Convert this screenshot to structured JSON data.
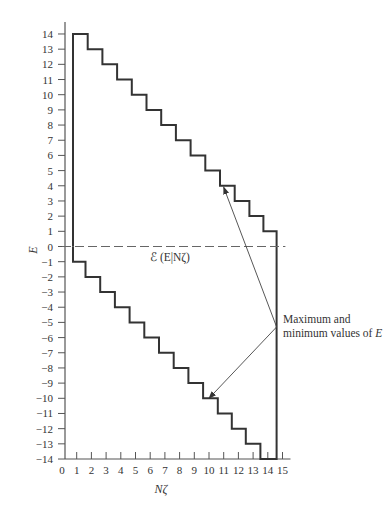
{
  "chart_data": {
    "type": "line",
    "subtype": "step",
    "title": "",
    "xlabel": "Nζ",
    "ylabel": "E",
    "xlim": [
      0,
      15
    ],
    "ylim": [
      -14,
      14
    ],
    "x_ticks": [
      0,
      1,
      2,
      3,
      4,
      5,
      6,
      7,
      8,
      9,
      10,
      11,
      12,
      13,
      14,
      15
    ],
    "y_ticks": [
      14,
      13,
      12,
      11,
      10,
      9,
      8,
      7,
      6,
      5,
      4,
      3,
      2,
      1,
      0,
      -1,
      -2,
      -3,
      -4,
      -5,
      -6,
      -7,
      -8,
      -9,
      -10,
      -11,
      -12,
      -13,
      -14
    ],
    "grid": false,
    "legend": null,
    "series": [
      {
        "name": "Maximum values of E",
        "style": "solid-step",
        "points": [
          [
            0.75,
            0
          ],
          [
            0.75,
            14
          ],
          [
            1.75,
            14
          ],
          [
            1.75,
            13
          ],
          [
            2.75,
            13
          ],
          [
            2.75,
            12
          ],
          [
            3.75,
            12
          ],
          [
            3.75,
            11
          ],
          [
            4.75,
            11
          ],
          [
            4.75,
            10
          ],
          [
            5.75,
            10
          ],
          [
            5.75,
            9
          ],
          [
            6.75,
            9
          ],
          [
            6.75,
            8
          ],
          [
            7.75,
            8
          ],
          [
            7.75,
            7
          ],
          [
            8.75,
            7
          ],
          [
            8.75,
            6
          ],
          [
            9.75,
            6
          ],
          [
            9.75,
            5
          ],
          [
            10.75,
            5
          ],
          [
            10.75,
            4
          ],
          [
            11.75,
            4
          ],
          [
            11.75,
            3
          ],
          [
            12.75,
            3
          ],
          [
            12.75,
            2
          ],
          [
            13.7,
            2
          ],
          [
            13.7,
            1
          ],
          [
            14.6,
            1
          ],
          [
            14.6,
            0
          ]
        ]
      },
      {
        "name": "Minimum values of E",
        "style": "solid-step",
        "points": [
          [
            0.75,
            0
          ],
          [
            0.75,
            -1
          ],
          [
            1.6,
            -1
          ],
          [
            1.6,
            -2
          ],
          [
            2.6,
            -2
          ],
          [
            2.6,
            -3
          ],
          [
            3.6,
            -3
          ],
          [
            3.6,
            -4
          ],
          [
            4.6,
            -4
          ],
          [
            4.6,
            -5
          ],
          [
            5.6,
            -5
          ],
          [
            5.6,
            -6
          ],
          [
            6.6,
            -6
          ],
          [
            6.6,
            -7
          ],
          [
            7.6,
            -7
          ],
          [
            7.6,
            -8
          ],
          [
            8.6,
            -8
          ],
          [
            8.6,
            -9
          ],
          [
            9.6,
            -9
          ],
          [
            9.6,
            -10
          ],
          [
            10.6,
            -10
          ],
          [
            10.6,
            -11
          ],
          [
            11.55,
            -11
          ],
          [
            11.55,
            -12
          ],
          [
            12.5,
            -12
          ],
          [
            12.5,
            -13
          ],
          [
            13.5,
            -13
          ],
          [
            13.5,
            -14
          ],
          [
            14.6,
            -14
          ],
          [
            14.6,
            0
          ]
        ]
      },
      {
        "name": "ℰ(E|Nζ)",
        "style": "dashed",
        "points": [
          [
            0,
            0
          ],
          [
            15.2,
            0
          ]
        ]
      }
    ],
    "annotations": [
      {
        "text_line1": "Maximum and",
        "text_line2": "minimum values of",
        "text_italic": "E",
        "arrows_to": [
          [
            11.0,
            3.9
          ],
          [
            10.0,
            -10.0
          ]
        ],
        "arrow_from": [
          14.6,
          -5.3
        ]
      },
      {
        "text": "ℰ (E|Nζ)",
        "position": [
          8.3,
          -0.7
        ]
      }
    ]
  },
  "labels": {
    "xlabel": "Nζ",
    "ylabel": "E",
    "mean_label": "ℰ (E|Nζ)",
    "annot_line1": "Maximum and",
    "annot_line2": "minimum values of ",
    "annot_var": "E"
  }
}
